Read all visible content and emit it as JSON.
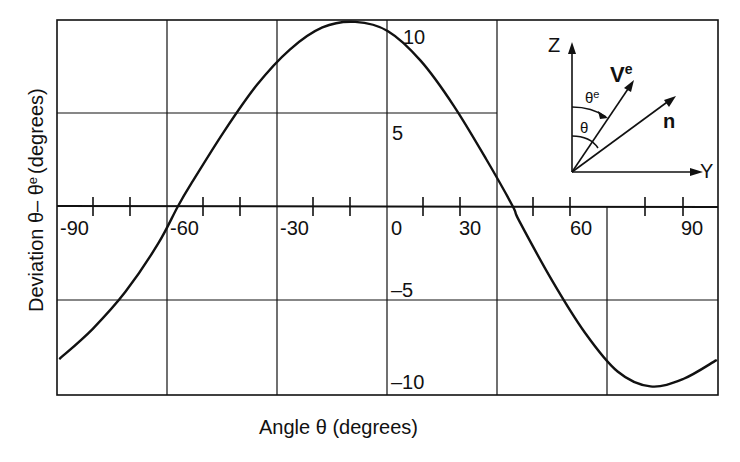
{
  "chart_data": {
    "type": "line",
    "title": "",
    "xlabel": "Angle θ (degrees)",
    "ylabel": "Deviation θ− θᵉ (degrees)",
    "xlim": [
      -100,
      100
    ],
    "ylim": [
      -10,
      10
    ],
    "grid": true,
    "x_ticks": [
      -90,
      -60,
      -30,
      0,
      30,
      60,
      90
    ],
    "y_ticks": [
      10,
      5,
      -5,
      -10
    ],
    "series": [
      {
        "name": "deviation",
        "x": [
          -100,
          -90,
          -80,
          -70,
          -64,
          -60,
          -50,
          -40,
          -30,
          -20,
          -10,
          0,
          10,
          20,
          30,
          38,
          40,
          50,
          60,
          70,
          80,
          90,
          100
        ],
        "y": [
          -8.2,
          -6.6,
          -4.6,
          -2.0,
          0.0,
          1.2,
          4.0,
          6.5,
          8.4,
          9.6,
          9.9,
          9.4,
          7.8,
          5.4,
          2.5,
          0.0,
          -0.8,
          -4.0,
          -6.8,
          -8.9,
          -9.7,
          -9.3,
          -8.3
        ]
      }
    ],
    "inset": {
      "axes": [
        "Z",
        "Y"
      ],
      "vectors": [
        "Vᵉ",
        "n"
      ],
      "angles": [
        "θᵉ",
        "θ"
      ]
    }
  },
  "labels": {
    "x_tick_labels": [
      "-90",
      "-60",
      "-30",
      "0",
      "30",
      "60",
      "90"
    ],
    "y_tick_labels": [
      "10",
      "5",
      "–5",
      "–10"
    ],
    "xlabel": "Angle θ  (degrees)",
    "ylabel_main": "Deviation  θ– θ",
    "ylabel_sup": "e",
    "ylabel_tail": "(degrees)",
    "inset_z": "Z",
    "inset_y": "Y",
    "inset_ve": "V",
    "inset_ve_sup": "e",
    "inset_n": "n",
    "inset_theta_e": "θ",
    "inset_theta_e_sup": "e",
    "inset_theta": "θ"
  }
}
